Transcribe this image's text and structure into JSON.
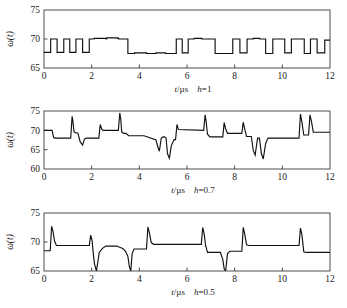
{
  "figure": {
    "background": "#ffffff",
    "trace_color": "#111111",
    "axis_color": "#3a3a3a"
  },
  "chart_data": [
    {
      "type": "line",
      "title": "",
      "xlabel": "t/µs",
      "ylabel": "ω(t)",
      "condition_label": "h=1",
      "condition_symbol": "h",
      "condition_value": "1",
      "xlim": [
        0,
        12
      ],
      "ylim": [
        65,
        75
      ],
      "xticks": [
        0,
        2,
        4,
        6,
        8,
        10,
        12
      ],
      "yticks": [
        65,
        70,
        75
      ],
      "grid": false,
      "legend": "none",
      "series": [
        {
          "name": "ω(t) h=1",
          "x": [
            0.0,
            0.28,
            0.28,
            0.55,
            0.55,
            0.83,
            0.83,
            1.08,
            1.08,
            1.34,
            1.34,
            1.62,
            1.62,
            1.9,
            1.9,
            2.1,
            2.1,
            2.6,
            2.6,
            2.63,
            2.63,
            3.1,
            3.1,
            3.13,
            3.13,
            3.52,
            3.52,
            3.8,
            3.8,
            4.3,
            4.3,
            4.7,
            4.7,
            5.1,
            5.1,
            5.55,
            5.55,
            5.8,
            5.8,
            6.05,
            6.05,
            6.3,
            6.3,
            6.62,
            6.62,
            7.18,
            7.18,
            7.92,
            7.92,
            8.22,
            8.22,
            8.52,
            8.52,
            8.78,
            8.78,
            9.05,
            9.05,
            9.3,
            9.3,
            9.6,
            9.6,
            10.1,
            10.1,
            10.38,
            10.38,
            10.62,
            10.62,
            10.92,
            10.92,
            11.18,
            11.18,
            11.46,
            11.46,
            11.78,
            11.78,
            12.0
          ],
          "y": [
            67.7,
            67.7,
            70.0,
            70.0,
            67.7,
            67.7,
            70.0,
            70.0,
            67.7,
            67.7,
            70.0,
            70.0,
            67.7,
            67.7,
            70.0,
            70.0,
            70.1,
            70.1,
            70.0,
            70.0,
            70.2,
            70.2,
            70.1,
            70.1,
            70.0,
            70.0,
            67.5,
            67.5,
            67.6,
            67.6,
            67.5,
            67.5,
            67.6,
            67.6,
            67.5,
            67.5,
            70.0,
            70.0,
            67.6,
            67.6,
            70.0,
            70.0,
            70.1,
            70.1,
            70.0,
            70.0,
            67.5,
            67.5,
            70.0,
            70.0,
            67.6,
            67.6,
            70.0,
            70.0,
            70.1,
            70.1,
            70.0,
            70.0,
            67.5,
            67.5,
            70.0,
            70.0,
            67.6,
            67.6,
            70.0,
            70.0,
            70.0,
            70.0,
            67.5,
            67.5,
            70.0,
            70.0,
            67.6,
            67.6,
            69.8,
            69.8
          ]
        }
      ]
    },
    {
      "type": "line",
      "title": "",
      "xlabel": "t/µs",
      "ylabel": "ω(t)",
      "condition_label": "h=0.7",
      "condition_symbol": "h",
      "condition_value": "0.7",
      "xlim": [
        0,
        12
      ],
      "ylim": [
        60,
        75
      ],
      "xticks": [
        0,
        2,
        4,
        6,
        8,
        10,
        12
      ],
      "yticks": [
        60,
        65,
        70,
        75
      ],
      "grid": false,
      "legend": "none",
      "series": [
        {
          "name": "ω(t) h=0.7",
          "x": [
            0.0,
            0.34,
            0.4,
            0.46,
            0.52,
            1.12,
            1.18,
            1.22,
            1.26,
            1.34,
            1.42,
            1.52,
            1.62,
            1.7,
            1.8,
            1.95,
            2.3,
            2.36,
            2.42,
            2.48,
            3.12,
            3.18,
            3.22,
            3.26,
            3.34,
            3.44,
            3.55,
            4.2,
            4.7,
            4.76,
            4.84,
            4.92,
            5.0,
            5.06,
            5.12,
            5.18,
            5.26,
            5.34,
            5.46,
            5.52,
            5.58,
            5.64,
            6.7,
            6.76,
            6.8,
            6.86,
            6.96,
            7.5,
            7.56,
            7.62,
            7.7,
            8.3,
            8.36,
            8.42,
            8.5,
            8.7,
            8.78,
            8.86,
            8.96,
            9.04,
            9.12,
            9.2,
            9.3,
            9.4,
            9.6,
            10.7,
            10.76,
            10.82,
            10.9,
            11.1,
            11.16,
            11.22,
            11.3,
            11.5,
            12.0
          ],
          "y": [
            70.0,
            70.0,
            68.2,
            68.0,
            68.0,
            68.0,
            73.6,
            72.0,
            69.6,
            69.3,
            69.3,
            67.0,
            66.2,
            67.8,
            68.0,
            68.0,
            68.0,
            71.5,
            70.3,
            70.0,
            70.0,
            74.5,
            73.0,
            69.6,
            69.2,
            69.2,
            68.6,
            68.6,
            67.5,
            66.0,
            64.6,
            68.0,
            68.3,
            68.3,
            68.0,
            64.0,
            62.8,
            66.0,
            67.6,
            67.6,
            71.5,
            70.2,
            70.0,
            74.0,
            72.4,
            69.0,
            68.3,
            68.3,
            72.0,
            70.4,
            69.2,
            69.2,
            72.1,
            70.4,
            68.4,
            68.4,
            64.8,
            63.6,
            68.0,
            68.0,
            64.0,
            62.6,
            66.6,
            68.0,
            68.0,
            68.0,
            74.2,
            72.2,
            68.8,
            68.8,
            74.0,
            72.4,
            69.5,
            69.5,
            69.5
          ]
        }
      ]
    },
    {
      "type": "line",
      "title": "",
      "xlabel": "t/µs",
      "ylabel": "ω(t)",
      "condition_label": "h=0.5",
      "condition_symbol": "h",
      "condition_value": "0.5",
      "xlim": [
        0,
        12
      ],
      "ylim": [
        65,
        75
      ],
      "xticks": [
        0,
        2,
        4,
        6,
        8,
        10,
        12
      ],
      "yticks": [
        65,
        70,
        75
      ],
      "grid": false,
      "legend": "none",
      "series": [
        {
          "name": "ω(t) h=0.5",
          "x": [
            0.0,
            0.26,
            0.32,
            0.38,
            0.44,
            0.52,
            0.62,
            1.9,
            1.96,
            2.02,
            2.06,
            2.12,
            2.2,
            2.32,
            2.45,
            2.6,
            3.05,
            3.3,
            3.42,
            3.52,
            3.58,
            3.64,
            3.7,
            3.78,
            4.3,
            4.36,
            4.42,
            4.5,
            4.6,
            6.6,
            6.66,
            6.72,
            6.78,
            6.86,
            6.96,
            7.4,
            7.5,
            7.56,
            7.62,
            7.7,
            7.8,
            8.3,
            8.36,
            8.42,
            8.5,
            8.6,
            10.7,
            10.76,
            10.82,
            10.9,
            11.0,
            12.0
          ],
          "y": [
            68.5,
            68.5,
            72.7,
            71.8,
            70.2,
            69.4,
            69.4,
            69.4,
            71.2,
            70.2,
            68.3,
            66.2,
            65.0,
            68.2,
            68.9,
            69.3,
            69.3,
            68.9,
            68.4,
            67.5,
            65.8,
            65.0,
            68.0,
            68.8,
            68.8,
            72.6,
            71.6,
            69.9,
            69.6,
            69.6,
            72.5,
            71.4,
            69.4,
            68.2,
            68.2,
            68.2,
            67.0,
            65.4,
            65.0,
            68.0,
            68.4,
            68.4,
            72.5,
            71.4,
            69.5,
            69.4,
            69.4,
            72.4,
            71.3,
            68.3,
            68.2,
            68.2
          ]
        }
      ]
    }
  ]
}
